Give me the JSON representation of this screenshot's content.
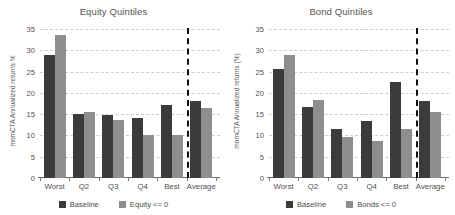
{
  "chart_data": [
    {
      "type": "bar",
      "title": "Equity Quintiles",
      "xlabel": "",
      "ylabel": "momCTA Annualized returns %",
      "categories": [
        "Worst",
        "Q2",
        "Q3",
        "Q4",
        "Best",
        "Average"
      ],
      "series": [
        {
          "name": "Baseline",
          "color": "#3b3b3b",
          "values": [
            28.8,
            15.0,
            14.8,
            14.0,
            17.2,
            18.0
          ]
        },
        {
          "name": "Equity <= 0",
          "color": "#8e8e8e",
          "values": [
            33.5,
            15.4,
            13.7,
            10.1,
            10.1,
            16.5
          ]
        }
      ],
      "ylim": [
        0,
        35
      ],
      "yticks": [
        0,
        5,
        10,
        15,
        20,
        25,
        30,
        35
      ],
      "grid": true,
      "legend_position": "bottom",
      "annotations": [
        {
          "type": "vertical-dashed-line",
          "before_category": "Average"
        }
      ]
    },
    {
      "type": "bar",
      "title": "Bond Quintiles",
      "xlabel": "",
      "ylabel": "momCTA Annualized returns (%)",
      "categories": [
        "Worst",
        "Q2",
        "Q3",
        "Q4",
        "Best",
        "Average"
      ],
      "series": [
        {
          "name": "Baseline",
          "color": "#3b3b3b",
          "values": [
            25.7,
            16.7,
            11.4,
            13.4,
            22.5,
            18.0
          ]
        },
        {
          "name": "Bonds <= 0",
          "color": "#8e8e8e",
          "values": [
            28.8,
            18.4,
            9.6,
            8.7,
            11.6,
            15.4
          ]
        }
      ],
      "ylim": [
        0,
        35
      ],
      "yticks": [
        0,
        5,
        10,
        15,
        20,
        25,
        30,
        35
      ],
      "grid": true,
      "legend_position": "bottom",
      "annotations": [
        {
          "type": "vertical-dashed-line",
          "before_category": "Average"
        }
      ]
    }
  ]
}
